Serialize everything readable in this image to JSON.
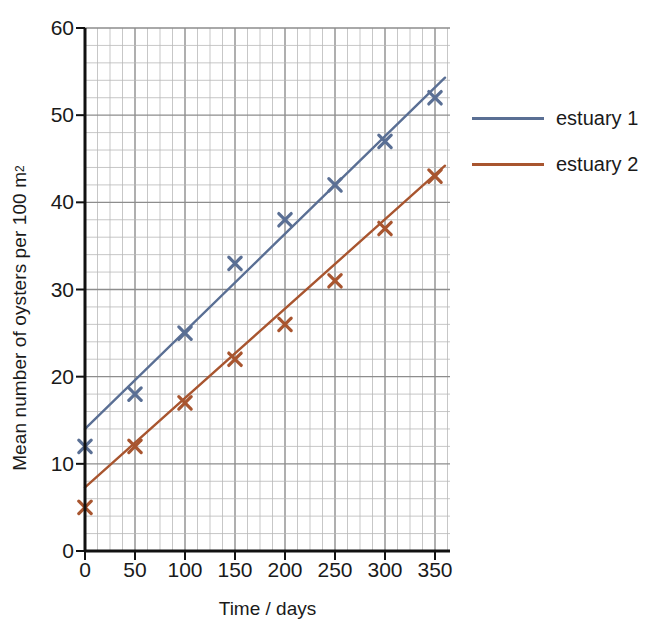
{
  "chart_data": {
    "type": "scatter",
    "title": "",
    "xlabel": "Time / days",
    "ylabel": "Mean number of oysters per 100 m²",
    "ylabel_main": "Mean number of oysters per 100 m",
    "ylabel_sup": "2",
    "xlim": [
      0,
      365
    ],
    "ylim": [
      0,
      60
    ],
    "xticks": [
      0,
      50,
      100,
      150,
      200,
      250,
      300,
      350
    ],
    "yticks": [
      0,
      10,
      20,
      30,
      40,
      50,
      60
    ],
    "xtick_labels": [
      "0",
      "50",
      "100",
      "150",
      "200",
      "250",
      "300",
      "350"
    ],
    "ytick_labels": [
      "0",
      "10",
      "20",
      "30",
      "40",
      "50",
      "60"
    ],
    "x_minor_step": 12.5,
    "y_minor_step": 2,
    "grid": true,
    "legend_position": "right",
    "series": [
      {
        "name": "estuary 1",
        "color": "#5a6f94",
        "marker": "x",
        "x": [
          0,
          50,
          100,
          150,
          200,
          250,
          300,
          350
        ],
        "values": [
          12,
          18,
          25,
          33,
          38,
          42,
          47,
          52
        ],
        "trendline": {
          "x0": 0,
          "y0": 14,
          "x1": 360,
          "y1": 54.3
        }
      },
      {
        "name": "estuary 2",
        "color": "#a8552f",
        "marker": "x",
        "x": [
          0,
          50,
          100,
          150,
          200,
          250,
          300,
          350
        ],
        "values": [
          5,
          12,
          17,
          22,
          26,
          31,
          37,
          43
        ],
        "trendline": {
          "x0": 0,
          "y0": 7.3,
          "x1": 360,
          "y1": 44.2
        }
      }
    ]
  },
  "legend": {
    "items": [
      {
        "label": "estuary 1",
        "color": "#5a6f94"
      },
      {
        "label": "estuary 2",
        "color": "#a8552f"
      }
    ]
  }
}
